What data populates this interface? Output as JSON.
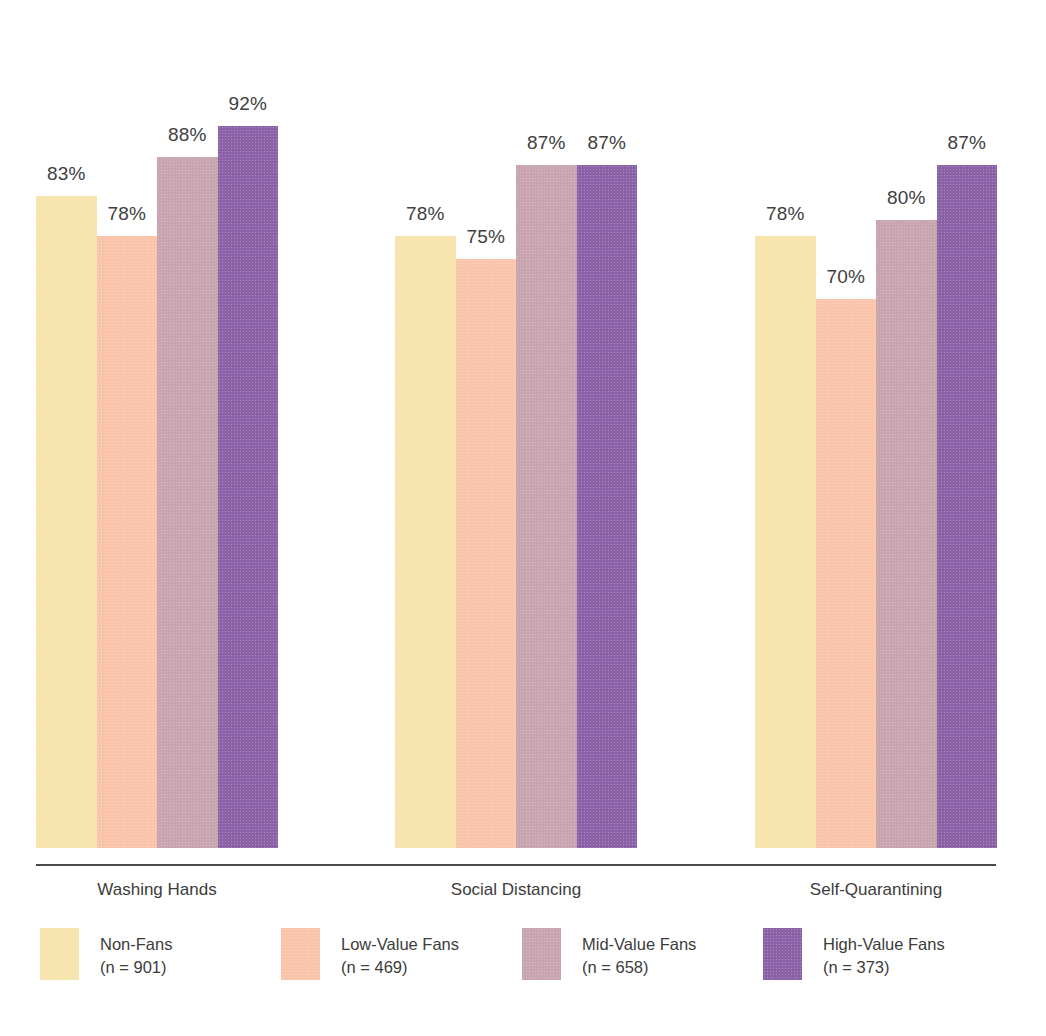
{
  "chart_data": {
    "type": "bar",
    "title": "",
    "subtitle": "",
    "xlabel": "",
    "ylabel": "",
    "ylim": [
      0,
      100
    ],
    "grid": false,
    "legend_position": "bottom",
    "value_suffix": "%",
    "categories": [
      "Washing Hands",
      "Social Distancing",
      "Self-Quarantining"
    ],
    "series": [
      {
        "name": "Non-Fans",
        "n_label": "(n = 901)",
        "n": 901,
        "color": "#F7E3AC",
        "values": [
          83,
          78,
          78
        ],
        "value_labels": [
          "83%",
          "78%",
          "78%"
        ]
      },
      {
        "name": "Low-Value Fans",
        "n_label": "(n = 469)",
        "n": 469,
        "color": "#FAC4AB",
        "values": [
          78,
          75,
          70
        ],
        "value_labels": [
          "78%",
          "75%",
          "70%"
        ]
      },
      {
        "name": "Mid-Value Fans",
        "n_label": "(n = 658)",
        "n": 658,
        "color": "#C8A4B0",
        "values": [
          88,
          87,
          80
        ],
        "value_labels": [
          "88%",
          "87%",
          "80%"
        ]
      },
      {
        "name": "High-Value Fans",
        "n_label": "(n = 373)",
        "n": 373,
        "color": "#8B62A8",
        "values": [
          92,
          87,
          87
        ],
        "value_labels": [
          "92%",
          "87%",
          "87%"
        ]
      }
    ]
  },
  "layout": {
    "axis_color": "#4a4a4a",
    "background": "#ffffff",
    "text_color": "#3c3c3c",
    "group_left_px": [
      36,
      395,
      755
    ],
    "group_width_px": 242,
    "bar_width_px": 60.5,
    "baseline_y_px": 848,
    "max_bar_height_px": 785
  }
}
